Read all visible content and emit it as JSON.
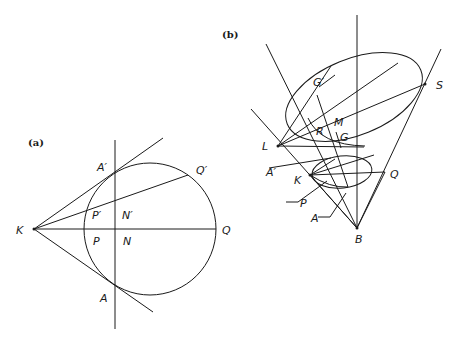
{
  "figure_a": {
    "panel_label": "(a)",
    "labels": {
      "K": "K",
      "A_prime": "A′",
      "Q_prime": "Q′",
      "P_prime": "P′",
      "N_prime": "N′",
      "P": "P",
      "N": "N",
      "Q": "Q",
      "A": "A"
    }
  },
  "figure_b": {
    "panel_label": "(b)",
    "labels": {
      "G_prime": "G′",
      "S": "S",
      "R": "R",
      "M": "M",
      "G": "G",
      "L": "L",
      "A_prime": "A′",
      "K": "K",
      "Q": "Q",
      "P": "P",
      "A": "A",
      "B": "B"
    }
  },
  "colors": {
    "ink": "#1a1a1a",
    "background": "#ffffff"
  }
}
